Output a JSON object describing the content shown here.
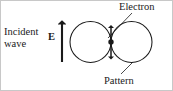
{
  "figure": {
    "type": "physics-diagram",
    "width": 173,
    "height": 91,
    "background_color": "#ffffff",
    "stroke_color": "#1a1a1a",
    "border_color": "#c8c8c8"
  },
  "labels": {
    "incident": "Incident",
    "wave": "wave",
    "efield": "E",
    "electron": "Electron",
    "pattern": "Pattern"
  },
  "geometry": {
    "left_circle": {
      "cx": 90.5,
      "cy": 42,
      "r": 20.5
    },
    "right_circle": {
      "cx": 131.5,
      "cy": 42,
      "r": 20.5
    },
    "electron_dot": {
      "cx": 111,
      "cy": 42,
      "r": 2.6
    },
    "incident_arrow": {
      "x": 62,
      "y_tail": 62,
      "y_head": 20
    },
    "oscillation_arrow": {
      "x": 111,
      "y_top": 24,
      "y_bottom": 60
    },
    "electron_leader": {
      "x1": 132,
      "y1": 13,
      "x2": 108,
      "y2": 38
    },
    "pattern_leader": {
      "x1": 121,
      "y1": 74,
      "x2": 133,
      "y2": 62
    }
  }
}
